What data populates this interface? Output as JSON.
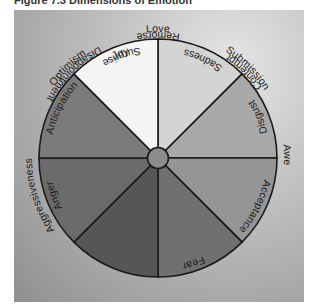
{
  "title": "Figure 7.3  Dimensions of Emotion",
  "colors": {
    "joy": "#f4f4f4",
    "acceptance": "#d4d4d4",
    "fear": "#a9a9a9",
    "surprise": "#959595",
    "sadness": "#707070",
    "disgust": "#565656",
    "anger": "#6b6b6b",
    "anticipation": "#7b7b7b",
    "center": "#8c8c8c",
    "outline": "#1a1a1a"
  },
  "primary_emotions": [
    {
      "label": "Acceptance"
    },
    {
      "label": "Fear"
    },
    {
      "label": "Surprise"
    },
    {
      "label": "Sadness"
    },
    {
      "label": "Disgust"
    },
    {
      "label": "Anger"
    },
    {
      "label": "Anticipation"
    },
    {
      "label": "Joy"
    }
  ],
  "dyads": [
    {
      "label": "Love"
    },
    {
      "label": "Submission"
    },
    {
      "label": "Awe"
    },
    {
      "label": "Disappointment"
    },
    {
      "label": "Remorse"
    },
    {
      "label": "Contempt"
    },
    {
      "label": "Aggressiveness"
    },
    {
      "label": "Optimism"
    }
  ]
}
